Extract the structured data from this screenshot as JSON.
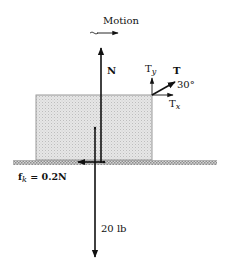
{
  "diagram": {
    "motion_label": "Motion",
    "normal_force_label": "N",
    "tension_label": "T",
    "tension_y_label": "T",
    "tension_y_sub": "y",
    "tension_x_label": "T",
    "tension_x_sub": "x",
    "angle_label": "30°",
    "friction_label_main": "f",
    "friction_label_sub": "k",
    "friction_label_rest": " = 0.2N",
    "weight_label": "20 lb",
    "colors": {
      "line": "#111111",
      "block_fill": "#e2e2e2",
      "block_border": "#9a9a9a",
      "ground_fill": "#c4c4c4"
    }
  }
}
